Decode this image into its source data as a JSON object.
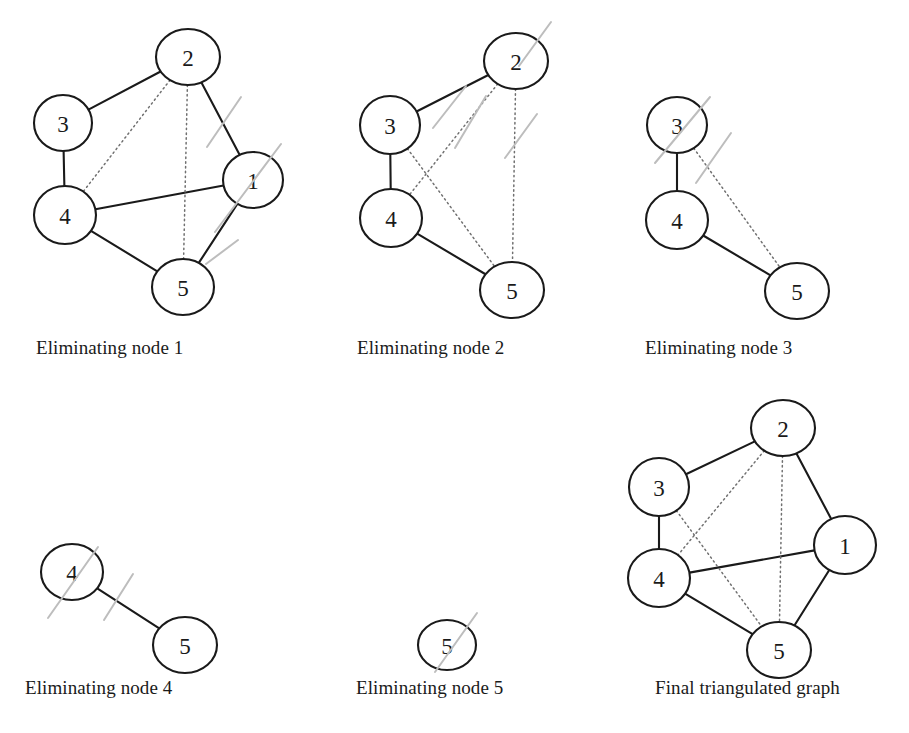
{
  "figure": {
    "background_color": "#ffffff",
    "node_stroke_color": "#1a1a1a",
    "node_fill_color": "#ffffff",
    "solid_edge_color": "#1a1a1a",
    "dotted_edge_color": "#707070",
    "strike_color": "#bdbdbd"
  },
  "panels": [
    {
      "id": "panel-1",
      "caption": "Eliminating node 1",
      "caption_x": 36,
      "caption_y": 337,
      "eliminated_node": "1",
      "nodes": [
        {
          "label": "2",
          "cx": 188,
          "cy": 57,
          "rx": 32,
          "ry": 28
        },
        {
          "label": "3",
          "cx": 63,
          "cy": 123,
          "rx": 29,
          "ry": 28
        },
        {
          "label": "1",
          "cx": 253,
          "cy": 180,
          "rx": 30,
          "ry": 28
        },
        {
          "label": "4",
          "cx": 65,
          "cy": 215,
          "rx": 31,
          "ry": 29
        },
        {
          "label": "5",
          "cx": 183,
          "cy": 287,
          "rx": 31,
          "ry": 28
        }
      ],
      "solid_edges": [
        [
          "2",
          "3"
        ],
        [
          "3",
          "4"
        ],
        [
          "2",
          "1"
        ],
        [
          "4",
          "1"
        ],
        [
          "4",
          "5"
        ],
        [
          "1",
          "5"
        ]
      ],
      "dotted_edges": [
        [
          "2",
          "4"
        ],
        [
          "2",
          "5"
        ]
      ],
      "strikes": [
        {
          "x1": 241,
          "y1": 97,
          "x2": 207,
          "y2": 147
        },
        {
          "x1": 281,
          "y1": 144,
          "x2": 215,
          "y2": 232
        },
        {
          "x1": 238,
          "y1": 240,
          "x2": 206,
          "y2": 264
        }
      ]
    },
    {
      "id": "panel-2",
      "caption": "Eliminating node 2",
      "caption_x": 357,
      "caption_y": 337,
      "eliminated_node": "2",
      "nodes": [
        {
          "label": "2",
          "cx": 516,
          "cy": 61,
          "rx": 32,
          "ry": 28
        },
        {
          "label": "3",
          "cx": 390,
          "cy": 125,
          "rx": 30,
          "ry": 29
        },
        {
          "label": "4",
          "cx": 391,
          "cy": 218,
          "rx": 31,
          "ry": 29
        },
        {
          "label": "5",
          "cx": 512,
          "cy": 290,
          "rx": 32,
          "ry": 28
        }
      ],
      "solid_edges": [
        [
          "2",
          "3"
        ],
        [
          "3",
          "4"
        ],
        [
          "4",
          "5"
        ]
      ],
      "dotted_edges": [
        [
          "2",
          "4"
        ],
        [
          "2",
          "5"
        ],
        [
          "3",
          "5"
        ]
      ],
      "strikes": [
        {
          "x1": 551,
          "y1": 22,
          "x2": 519,
          "y2": 66
        },
        {
          "x1": 466,
          "y1": 86,
          "x2": 433,
          "y2": 128
        },
        {
          "x1": 486,
          "y1": 96,
          "x2": 455,
          "y2": 148
        },
        {
          "x1": 537,
          "y1": 114,
          "x2": 505,
          "y2": 158
        }
      ]
    },
    {
      "id": "panel-3",
      "caption": "Eliminating node 3",
      "caption_x": 645,
      "caption_y": 337,
      "eliminated_node": "3",
      "nodes": [
        {
          "label": "3",
          "cx": 677,
          "cy": 125,
          "rx": 30,
          "ry": 28
        },
        {
          "label": "4",
          "cx": 677,
          "cy": 220,
          "rx": 31,
          "ry": 29
        },
        {
          "label": "5",
          "cx": 797,
          "cy": 291,
          "rx": 32,
          "ry": 28
        }
      ],
      "solid_edges": [
        [
          "3",
          "4"
        ],
        [
          "4",
          "5"
        ]
      ],
      "dotted_edges": [
        [
          "3",
          "5"
        ]
      ],
      "strikes": [
        {
          "x1": 710,
          "y1": 97,
          "x2": 655,
          "y2": 163
        },
        {
          "x1": 731,
          "y1": 133,
          "x2": 696,
          "y2": 183
        }
      ]
    },
    {
      "id": "panel-4",
      "caption": "Eliminating node 4",
      "caption_x": 25,
      "caption_y": 677,
      "eliminated_node": "4",
      "nodes": [
        {
          "label": "4",
          "cx": 72,
          "cy": 572,
          "rx": 31,
          "ry": 28
        },
        {
          "label": "5",
          "cx": 185,
          "cy": 645,
          "rx": 32,
          "ry": 28
        }
      ],
      "solid_edges": [
        [
          "4",
          "5"
        ]
      ],
      "dotted_edges": [],
      "strikes": [
        {
          "x1": 98,
          "y1": 547,
          "x2": 48,
          "y2": 618
        },
        {
          "x1": 133,
          "y1": 574,
          "x2": 104,
          "y2": 620
        }
      ]
    },
    {
      "id": "panel-5",
      "caption": "Eliminating node 5",
      "caption_x": 356,
      "caption_y": 677,
      "eliminated_node": "5",
      "nodes": [
        {
          "label": "5",
          "cx": 447,
          "cy": 645,
          "rx": 29,
          "ry": 25
        }
      ],
      "solid_edges": [],
      "dotted_edges": [],
      "strikes": [
        {
          "x1": 477,
          "y1": 613,
          "x2": 435,
          "y2": 672
        }
      ]
    },
    {
      "id": "panel-6",
      "caption": "Final triangulated graph",
      "caption_x": 655,
      "caption_y": 677,
      "eliminated_node": null,
      "nodes": [
        {
          "label": "2",
          "cx": 783,
          "cy": 428,
          "rx": 32,
          "ry": 28
        },
        {
          "label": "3",
          "cx": 659,
          "cy": 487,
          "rx": 30,
          "ry": 29
        },
        {
          "label": "1",
          "cx": 845,
          "cy": 545,
          "rx": 31,
          "ry": 29
        },
        {
          "label": "4",
          "cx": 659,
          "cy": 578,
          "rx": 31,
          "ry": 29
        },
        {
          "label": "5",
          "cx": 779,
          "cy": 650,
          "rx": 32,
          "ry": 28
        }
      ],
      "solid_edges": [
        [
          "2",
          "3"
        ],
        [
          "3",
          "4"
        ],
        [
          "2",
          "1"
        ],
        [
          "4",
          "1"
        ],
        [
          "4",
          "5"
        ],
        [
          "1",
          "5"
        ]
      ],
      "dotted_edges": [
        [
          "2",
          "4"
        ],
        [
          "2",
          "5"
        ],
        [
          "3",
          "5"
        ]
      ],
      "strikes": []
    }
  ]
}
